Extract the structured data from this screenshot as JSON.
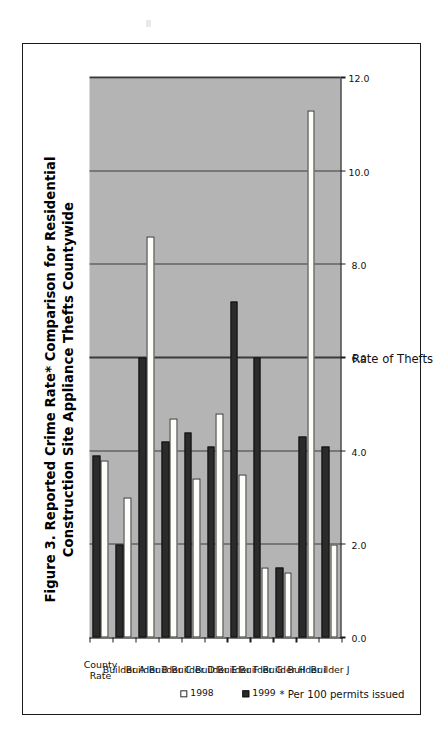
{
  "figure": {
    "title_line1": "Figure 3. Reported Crime Rate* Comparison for Residential",
    "title_line2": "Construction Site Appliance Thefts Countywide",
    "footnote": "* Per 100 permits issued"
  },
  "legend": {
    "items": [
      {
        "label": "1998",
        "swatch": "white-square",
        "color": "#ffffff"
      },
      {
        "label": "1999",
        "swatch": "black-square",
        "color": "#2b2b2b"
      }
    ]
  },
  "axis": {
    "value_axis_title": "Rate of Thefts",
    "value_ticks": [
      "0.0",
      "2.0",
      "4.0",
      "6.0",
      "8.0",
      "10.0",
      "12.0"
    ]
  },
  "chart_data": {
    "type": "bar",
    "orientation": "horizontal",
    "title": "Figure 3. Reported Crime Rate* Comparison for Residential Construction Site Appliance Thefts Countywide",
    "xlabel": "",
    "ylabel": "Rate of Thefts",
    "ylim": [
      0.0,
      12.0
    ],
    "ytick_step": 2.0,
    "grid": true,
    "legend_position": "below-axis-right",
    "annotations": [
      "* Per 100 permits issued"
    ],
    "categories": [
      "County Rate",
      "Builder A",
      "Builder B",
      "Builder C",
      "Builder D",
      "Builder E",
      "Builder F",
      "Builder G",
      "Builder H",
      "Builder I",
      "Builder J"
    ],
    "series": [
      {
        "name": "1998",
        "color": "#ffffff",
        "values": [
          3.8,
          3.0,
          8.6,
          4.7,
          3.4,
          4.8,
          3.5,
          1.5,
          1.4,
          11.3,
          2.0
        ]
      },
      {
        "name": "1999",
        "color": "#2b2b2b",
        "values": [
          3.9,
          2.0,
          6.0,
          4.2,
          4.4,
          4.1,
          7.2,
          6.0,
          1.5,
          4.3,
          4.1
        ]
      }
    ]
  }
}
